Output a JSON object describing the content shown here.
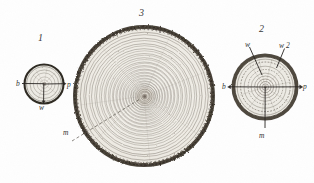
{
  "plate": {
    "title": "Tree trunk cross-sections showing annual growth rings",
    "background_color": "#fefefe",
    "ink_color": "#2b2b2b",
    "ring_color": "#5a5248",
    "bark_color": "#3a3329",
    "pith_color": "#6b6259"
  },
  "figures": [
    {
      "id": "figure-1",
      "number": "1",
      "caption_position": "top",
      "description": "Small sapling cross-section, few rings",
      "center": {
        "x": 44,
        "y": 84
      },
      "radius": 20,
      "ring_count": 4,
      "labels": [
        {
          "key": "b",
          "text": "b",
          "x": 16,
          "y": 80,
          "anchor": "left"
        },
        {
          "key": "p",
          "text": "p",
          "x": 67,
          "y": 81,
          "anchor": "right"
        },
        {
          "key": "w",
          "text": "w",
          "x": 39,
          "y": 104,
          "anchor": "bottom"
        }
      ]
    },
    {
      "id": "figure-3",
      "number": "3",
      "caption_position": "top",
      "description": "Large mature trunk cross-section with many annual rings and rough bark",
      "center": {
        "x": 144,
        "y": 96
      },
      "radius": 72,
      "ring_count": 34,
      "labels": [
        {
          "key": "m",
          "text": "m",
          "x": 63,
          "y": 129,
          "anchor": "left"
        }
      ]
    },
    {
      "id": "figure-2",
      "number": "2",
      "caption_position": "top",
      "description": "Medium trunk cross-section with two marked wood zones",
      "center": {
        "x": 265,
        "y": 87
      },
      "radius": 34,
      "ring_count": 9,
      "labels": [
        {
          "key": "w",
          "text": "w",
          "x": 245,
          "y": 41,
          "anchor": "leader-up-left"
        },
        {
          "key": "w2",
          "text": "w 2",
          "x": 279,
          "y": 42,
          "anchor": "leader-up-right"
        },
        {
          "key": "b",
          "text": "b",
          "x": 222,
          "y": 83,
          "anchor": "left"
        },
        {
          "key": "p",
          "text": "p",
          "x": 303,
          "y": 83,
          "anchor": "right"
        },
        {
          "key": "m",
          "text": "m",
          "x": 259,
          "y": 132,
          "anchor": "bottom"
        }
      ]
    }
  ],
  "legend_keys": {
    "b": "bark",
    "p": "pith",
    "w": "wood / annual ring zone",
    "w2": "second wood zone",
    "m": "medullary ray / marrow line"
  }
}
